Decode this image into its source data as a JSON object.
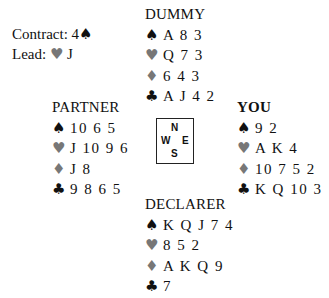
{
  "info": {
    "contract_label": "Contract: 4",
    "contract_suit": "♠",
    "lead_label": "Lead: ",
    "lead_suit": "♥",
    "lead_card": "J"
  },
  "suits": {
    "spades": "♠",
    "hearts": "♥",
    "diamonds": "♦",
    "clubs": "♣"
  },
  "colors": {
    "black_suit": "#111111",
    "red_suit_rendered": "#777777"
  },
  "hands": {
    "north": {
      "title": "DUMMY",
      "spades": "A 8 3",
      "hearts": "Q 7 3",
      "diamonds": "6 4 3",
      "clubs": "A J 4 2"
    },
    "west": {
      "title": "PARTNER",
      "spades": "10 6 5",
      "hearts": "J 10 9 6",
      "diamonds": "J 8",
      "clubs": "9 8 6 5"
    },
    "east": {
      "title": "YOU",
      "spades": "9 2",
      "hearts": "A K 4",
      "diamonds": "10 7 5 2",
      "clubs": "K Q 10 3"
    },
    "south": {
      "title": "DECLARER",
      "spades": "K Q J 7 4",
      "hearts": "8 5 2",
      "diamonds": "A K Q 9",
      "clubs": "7"
    }
  },
  "compass": {
    "n": "N",
    "w": "W",
    "e": "E",
    "s": "S"
  }
}
